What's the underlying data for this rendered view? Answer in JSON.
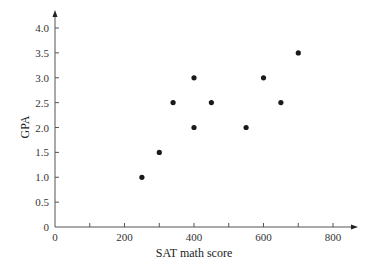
{
  "chart_data": {
    "type": "scatter",
    "title": "",
    "xlabel": "SAT math score",
    "ylabel": "GPA",
    "xlim": [
      0,
      850
    ],
    "ylim": [
      0,
      4.3
    ],
    "x_ticks": [
      0,
      100,
      200,
      300,
      400,
      500,
      600,
      700,
      800
    ],
    "x_tick_labels": [
      "0",
      "",
      "200",
      "",
      "400",
      "",
      "600",
      "",
      "800"
    ],
    "y_ticks": [
      0,
      0.5,
      1.0,
      1.5,
      2.0,
      2.5,
      3.0,
      3.5,
      4.0
    ],
    "y_tick_labels": [
      "0",
      "0.5",
      "1.0",
      "1.5",
      "2.0",
      "2.5",
      "3.0",
      "3.5",
      "4.0"
    ],
    "grid": false,
    "legend": null,
    "points": [
      {
        "x": 250,
        "y": 1.0
      },
      {
        "x": 300,
        "y": 1.5
      },
      {
        "x": 340,
        "y": 2.5
      },
      {
        "x": 400,
        "y": 3.0
      },
      {
        "x": 400,
        "y": 2.0
      },
      {
        "x": 450,
        "y": 2.5
      },
      {
        "x": 550,
        "y": 2.0
      },
      {
        "x": 600,
        "y": 3.0
      },
      {
        "x": 650,
        "y": 2.5
      },
      {
        "x": 700,
        "y": 3.5
      }
    ],
    "marker_color": "#1a1a1a",
    "axis_color": "#555555"
  }
}
